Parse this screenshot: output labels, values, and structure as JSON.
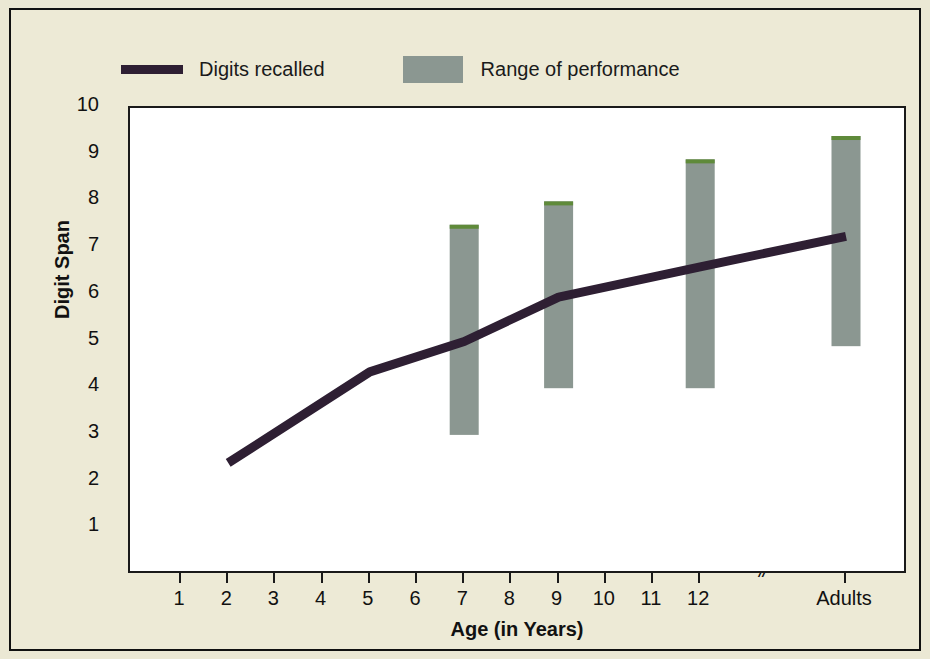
{
  "legend": {
    "items": [
      {
        "label": "Digits recalled",
        "marker": "line-swatch",
        "color": "#2e1f33"
      },
      {
        "label": "Range of performance",
        "marker": "box-swatch",
        "color": "#8b9791"
      }
    ]
  },
  "axes": {
    "ylabel": "Digit Span",
    "xlabel": "Age (in Years)",
    "break_symbol": "//"
  },
  "colors": {
    "background": "#edead6",
    "plot_background": "#ffffff",
    "line": "#2e1f33",
    "bar": "#8b9791",
    "bar_cap": "#5f8a3a",
    "axis": "#1a1a1a"
  },
  "chart_data": {
    "type": "line",
    "title": "",
    "xlabel": "Age (in Years)",
    "ylabel": "Digit Span",
    "ylim": [
      0,
      10
    ],
    "yticks": [
      1,
      2,
      3,
      4,
      5,
      6,
      7,
      8,
      9,
      10
    ],
    "xticks": [
      "1",
      "2",
      "3",
      "4",
      "5",
      "6",
      "7",
      "8",
      "9",
      "10",
      "11",
      "12",
      "Adults"
    ],
    "x_axis_break_after": "12",
    "grid": false,
    "legend_position": "above-plot-left",
    "series": [
      {
        "name": "Digits recalled",
        "type": "line",
        "color": "#2e1f33",
        "x": [
          "2",
          "5",
          "7",
          "9",
          "12",
          "Adults"
        ],
        "values": [
          2.4,
          4.35,
          5.0,
          5.95,
          6.6,
          7.25
        ]
      },
      {
        "name": "Range of performance",
        "type": "range-bar",
        "color": "#8b9791",
        "x": [
          "7",
          "9",
          "12",
          "Adults"
        ],
        "low": [
          3.0,
          4.0,
          4.0,
          4.9
        ],
        "high": [
          7.5,
          8.0,
          8.9,
          9.4
        ]
      }
    ]
  }
}
